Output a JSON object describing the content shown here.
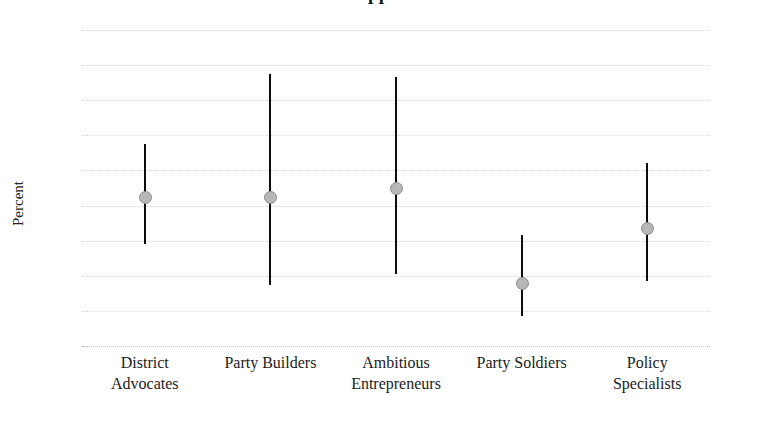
{
  "chart_data": {
    "type": "scatter",
    "title": "Support",
    "title_cropped": true,
    "xlabel": "",
    "ylabel": "Percent",
    "ylim": [
      0,
      18
    ],
    "yticks": [
      0,
      2,
      4,
      6,
      8,
      10,
      12,
      14,
      16,
      18
    ],
    "ytick_labels": [
      "0",
      "2",
      "4",
      "6",
      "8",
      "10",
      "12",
      "14",
      "16",
      "18"
    ],
    "grid": true,
    "legend": "none",
    "categories": [
      "District Advocates",
      "Party Builders",
      "Ambitious Entrepreneurs",
      "Party Soldiers",
      "Policy Specialists"
    ],
    "category_lines": [
      [
        "District",
        "Advocates"
      ],
      [
        "Party Builders",
        ""
      ],
      [
        "Ambitious",
        "Entrepreneurs"
      ],
      [
        "Party Soldiers",
        ""
      ],
      [
        "Policy",
        "Specialists"
      ]
    ],
    "values": [
      8.5,
      8.5,
      9.0,
      3.6,
      6.7
    ],
    "error_low": [
      5.8,
      3.5,
      4.1,
      1.7,
      3.7
    ],
    "error_high": [
      11.5,
      15.5,
      15.3,
      6.3,
      10.4
    ],
    "points": [
      {
        "category": "District Advocates",
        "value": 8.5,
        "low": 5.8,
        "high": 11.5
      },
      {
        "category": "Party Builders",
        "value": 8.5,
        "low": 3.5,
        "high": 15.5
      },
      {
        "category": "Ambitious Entrepreneurs",
        "value": 9.0,
        "low": 4.1,
        "high": 15.3
      },
      {
        "category": "Party Soldiers",
        "value": 3.6,
        "low": 1.7,
        "high": 6.3
      },
      {
        "category": "Policy Specialists",
        "value": 6.7,
        "low": 3.7,
        "high": 10.4
      }
    ],
    "colors": {
      "marker_fill": "#b7b7b7",
      "marker_edge": "#8e8e8e",
      "errorbar": "#0d0d0d",
      "gridline": "#d8d8d8",
      "text": "#1b1b1b",
      "background": "#ffffff"
    }
  }
}
